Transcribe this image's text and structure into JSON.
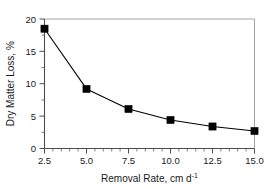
{
  "chart_data": {
    "type": "line",
    "title": "",
    "subtitle": "",
    "xlabel": "Removal Rate, cm d",
    "xlabel_exponent": "-1",
    "ylabel": "Dry Matter Loss, %",
    "x": [
      2.5,
      5.0,
      7.5,
      10.0,
      12.5,
      15.0
    ],
    "values": [
      18.5,
      9.2,
      6.1,
      4.4,
      3.4,
      2.7
    ],
    "series": [
      {
        "name": "Dry Matter Loss",
        "values": [
          18.5,
          9.2,
          6.1,
          4.4,
          3.4,
          2.7
        ],
        "marker": "filled-square",
        "marker_color": "#000000",
        "line_color": "#000000"
      }
    ],
    "xlim": [
      2.5,
      15.0
    ],
    "ylim": [
      0,
      20
    ],
    "x_ticks": [
      2.5,
      5.0,
      7.5,
      10.0,
      12.5,
      15.0
    ],
    "x_tick_labels": [
      "2.5",
      "5.0",
      "7.5",
      "10.0",
      "12.5",
      "15.0"
    ],
    "x_minor_step": 0.5,
    "y_ticks": [
      0,
      5,
      10,
      15,
      20
    ],
    "y_tick_labels": [
      "0",
      "5",
      "10",
      "15",
      "20"
    ],
    "y_minor_step": 2.5,
    "grid": false,
    "legend": false,
    "legend_position": "none",
    "annotations": [],
    "background_color": "#ffffff",
    "frame": true,
    "frame_color_major": "#4d4d4d",
    "frame_color_minor": "#9a9a9a"
  },
  "axes": {
    "x_tick_labels": [
      "2.5",
      "5.0",
      "7.5",
      "10.0",
      "12.5",
      "15.0"
    ],
    "y_tick_labels": [
      "0",
      "5",
      "10",
      "15",
      "20"
    ],
    "x_title_text": "Removal Rate, cm d",
    "x_title_exponent": "-1",
    "y_title_text": "Dry Matter Loss, %"
  }
}
